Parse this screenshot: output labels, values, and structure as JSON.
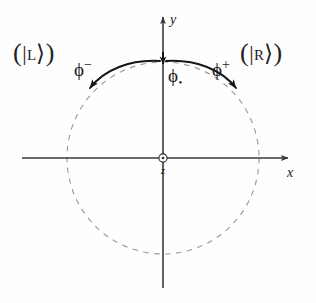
{
  "figure": {
    "type": "vector-diagram",
    "background_color": "#fefefe",
    "description_labels": {
      "left_state": {
        "open_paren": "(",
        "bar": "|",
        "letter": "L",
        "angle": "⟩",
        "close_paren": ")"
      },
      "right_state": {
        "open_paren": "(",
        "bar": "|",
        "letter": "R",
        "angle": "⟩",
        "close_paren": ")"
      }
    },
    "axes": {
      "x_label": "x",
      "y_label": "y",
      "origin_label": "z",
      "origin_marker": "circled-dot-icon",
      "axis_color": "#3a3a38"
    },
    "circle": {
      "style": "dashed",
      "color": "#8c8c8c",
      "center_x": 163,
      "center_y": 158,
      "radius": 96
    },
    "arrows": {
      "left": {
        "label_phi": "ϕ",
        "label_sup": "−",
        "color": "#1a1a1a"
      },
      "right": {
        "label_phi": "ϕ",
        "label_sup": "+",
        "color": "#1a1a1a"
      },
      "center": {
        "label_phi": "ϕ",
        "label_sub": "•",
        "color": "#1a1a1a"
      }
    }
  }
}
